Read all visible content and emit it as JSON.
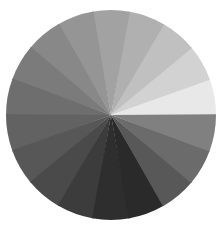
{
  "chart_data": {
    "type": "pie",
    "title": "",
    "subtitle": "",
    "xlabel": "",
    "ylabel": "",
    "legend_position": "none",
    "grid": false,
    "equal_slices": true,
    "slice_count": 18,
    "slice_angle_degrees": 20,
    "start_angle_degrees": 0,
    "direction": "counterclockwise",
    "background_color": "#ffffff",
    "center_x": 111,
    "center_y": 115,
    "radius": 105,
    "categories": [
      "w01",
      "w02",
      "w03",
      "w04",
      "w05",
      "w06",
      "w07",
      "w08",
      "w09",
      "w10",
      "w11",
      "w12",
      "w13",
      "w14",
      "w15",
      "w16",
      "w17",
      "w18"
    ],
    "values": [
      5.56,
      5.56,
      5.56,
      5.56,
      5.56,
      5.56,
      5.56,
      5.56,
      5.56,
      5.56,
      5.56,
      5.56,
      5.56,
      5.56,
      5.56,
      5.56,
      5.56,
      5.56
    ],
    "colors": [
      "#e8e8e8",
      "#d2d2d2",
      "#c0c0c0",
      "#b0b0b0",
      "#a2a2a2",
      "#959595",
      "#888888",
      "#7b7b7b",
      "#6e6e6e",
      "#626262",
      "#575757",
      "#4a4a4a",
      "#3c3c3c",
      "#2e2e2e",
      "#2a2a2a",
      "#585858",
      "#6b6b6b",
      "#808080"
    ],
    "gray_levels": [
      232,
      210,
      192,
      176,
      162,
      149,
      136,
      123,
      110,
      98,
      87,
      74,
      60,
      46,
      42,
      88,
      107,
      128
    ],
    "lightest_slice": "w01",
    "lightest_color": "#e8e8e8",
    "darkest_slice": "w15",
    "darkest_color": "#2a2a2a",
    "annotations": []
  }
}
